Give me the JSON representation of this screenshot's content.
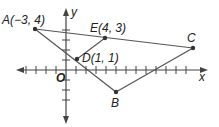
{
  "axes": {
    "x_label": "x",
    "y_label": "y",
    "origin_label": "O"
  },
  "points": {
    "A": {
      "label": "A(−3, 4)",
      "x": -3,
      "y": 4
    },
    "E": {
      "label": "E(4, 3)",
      "x": 4,
      "y": 3
    },
    "D": {
      "label": "D(1, 1)",
      "x": 1,
      "y": 1
    },
    "C": {
      "label": "C"
    },
    "B": {
      "label": "B"
    }
  },
  "segments": [
    "AC",
    "AB",
    "BC",
    "DE"
  ],
  "colors": {
    "line": "#555555",
    "axis": "#444444",
    "text": "#222222"
  }
}
